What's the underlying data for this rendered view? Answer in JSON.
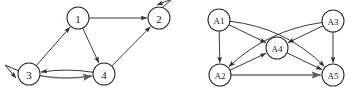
{
  "figure": {
    "background_color": "#ffffff",
    "stroke_color": "#3a3a3a",
    "node_fill": "#ffffff",
    "node_stroke": "#2b2b2b",
    "label_color": "#1a1a1a"
  },
  "graphs": [
    {
      "id": "graph-left",
      "name": "numeric-digraph",
      "node_radius": 11,
      "nodes": [
        {
          "id": "n1",
          "label": "1",
          "x": 78,
          "y": 18,
          "self_loop": false,
          "font_size": 11
        },
        {
          "id": "n2",
          "label": "2",
          "x": 159,
          "y": 18,
          "self_loop": true,
          "loop_dir": "up-right",
          "font_size": 11
        },
        {
          "id": "n3",
          "label": "3",
          "x": 29,
          "y": 74,
          "self_loop": true,
          "loop_dir": "left",
          "font_size": 11
        },
        {
          "id": "n4",
          "label": "4",
          "x": 104,
          "y": 74,
          "self_loop": false,
          "font_size": 11
        }
      ],
      "edges": [
        {
          "from": "n1",
          "to": "n2",
          "style": "straight",
          "curve": 0,
          "weight": "normal"
        },
        {
          "from": "n1",
          "to": "n4",
          "style": "straight",
          "curve": 0,
          "weight": "normal"
        },
        {
          "from": "n3",
          "to": "n1",
          "style": "straight",
          "curve": 0,
          "weight": "normal"
        },
        {
          "from": "n4",
          "to": "n2",
          "style": "straight",
          "curve": 0,
          "weight": "normal"
        },
        {
          "from": "n3",
          "to": "n4",
          "style": "curved",
          "curve": 6,
          "weight": "thick"
        },
        {
          "from": "n4",
          "to": "n3",
          "style": "curved",
          "curve": 6,
          "weight": "normal"
        }
      ]
    },
    {
      "id": "graph-right",
      "name": "labelled-digraph",
      "node_radius": 11,
      "nodes": [
        {
          "id": "a1",
          "label": "A1",
          "x": 219,
          "y": 20,
          "self_loop": false,
          "font_size": 9
        },
        {
          "id": "a3",
          "label": "A3",
          "x": 333,
          "y": 21,
          "self_loop": false,
          "font_size": 9
        },
        {
          "id": "a4",
          "label": "A4",
          "x": 277,
          "y": 48,
          "self_loop": false,
          "font_size": 9
        },
        {
          "id": "a2",
          "label": "A2",
          "x": 220,
          "y": 75,
          "self_loop": false,
          "font_size": 9
        },
        {
          "id": "a5",
          "label": "A5",
          "x": 333,
          "y": 75,
          "self_loop": false,
          "font_size": 9
        }
      ],
      "edges": [
        {
          "from": "a1",
          "to": "a2",
          "style": "straight",
          "curve": 0,
          "weight": "normal"
        },
        {
          "from": "a1",
          "to": "a4",
          "style": "straight",
          "curve": 0,
          "weight": "normal"
        },
        {
          "from": "a1",
          "to": "a5",
          "style": "curved",
          "curve": -22,
          "weight": "normal"
        },
        {
          "from": "a2",
          "to": "a4",
          "style": "straight",
          "curve": 0,
          "weight": "normal"
        },
        {
          "from": "a2",
          "to": "a5",
          "style": "straight",
          "curve": 0,
          "weight": "thick"
        },
        {
          "from": "a3",
          "to": "a4",
          "style": "straight",
          "curve": 0,
          "weight": "normal"
        },
        {
          "from": "a3",
          "to": "a5",
          "style": "straight",
          "curve": 0,
          "weight": "normal"
        },
        {
          "from": "a3",
          "to": "a2",
          "style": "curved",
          "curve": 20,
          "weight": "normal"
        },
        {
          "from": "a4",
          "to": "a5",
          "style": "straight",
          "curve": 0,
          "weight": "normal"
        }
      ]
    }
  ]
}
